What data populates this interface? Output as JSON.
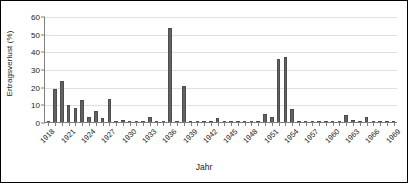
{
  "chart_data": {
    "type": "bar",
    "title": "",
    "xlabel": "Jahr",
    "ylabel": "Ertragsverlust (%)",
    "ylim": [
      0,
      60
    ],
    "ytick_labels": [
      "0",
      "10",
      "20",
      "30",
      "40",
      "50",
      "60"
    ],
    "ytick_values": [
      0,
      10,
      20,
      30,
      40,
      50,
      60
    ],
    "grid": true,
    "legend": "none",
    "bar_color": "#636363",
    "categories": [
      "1918",
      "1919",
      "1920",
      "1921",
      "1922",
      "1923",
      "1924",
      "1925",
      "1926",
      "1927",
      "1928",
      "1929",
      "1930",
      "1931",
      "1932",
      "1933",
      "1934",
      "1935",
      "1936",
      "1937",
      "1938",
      "1939",
      "1940",
      "1941",
      "1942",
      "1943",
      "1944",
      "1945",
      "1946",
      "1947",
      "1948",
      "1949",
      "1950",
      "1951",
      "1952",
      "1953",
      "1954",
      "1955",
      "1956",
      "1957",
      "1958",
      "1959",
      "1960",
      "1961",
      "1962",
      "1963",
      "1964",
      "1965",
      "1966",
      "1967",
      "1968",
      "1969"
    ],
    "values": [
      0.4,
      19.0,
      24.0,
      10.3,
      8.4,
      13.0,
      3.2,
      6.8,
      3.0,
      13.6,
      0.8,
      1.5,
      0.3,
      0.2,
      0.3,
      3.4,
      0.2,
      0.1,
      54.0,
      0.2,
      21.0,
      0.1,
      0.2,
      0.1,
      0.1,
      2.7,
      0.1,
      0.1,
      0.2,
      0.1,
      0.1,
      0.2,
      5.0,
      3.2,
      36.5,
      37.5,
      7.8,
      0.2,
      0.1,
      0.1,
      0.1,
      0.1,
      0.2,
      1.2,
      4.6,
      1.5,
      1.3,
      3.4,
      0.4,
      0.2,
      0.1,
      0.1
    ],
    "xtick_labels": [
      "1918",
      "1921",
      "1924",
      "1927",
      "1930",
      "1933",
      "1936",
      "1939",
      "1942",
      "1945",
      "1948",
      "1951",
      "1954",
      "1957",
      "1960",
      "1963",
      "1966",
      "1969"
    ]
  }
}
